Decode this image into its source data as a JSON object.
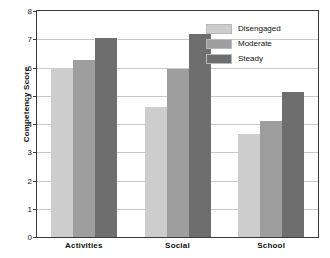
{
  "chart_data": {
    "type": "bar",
    "title": "",
    "xlabel": "",
    "ylabel": "Competency Score",
    "categories": [
      "Activities",
      "Social",
      "School"
    ],
    "series": [
      {
        "name": "Disengaged",
        "color": "#cdcdcd",
        "values": [
          6.0,
          4.6,
          3.65
        ]
      },
      {
        "name": "Moderate",
        "color": "#9e9e9e",
        "values": [
          6.25,
          5.95,
          4.1
        ]
      },
      {
        "name": "Steady",
        "color": "#6e6e6e",
        "values": [
          7.05,
          7.2,
          5.15
        ]
      }
    ],
    "ylim": [
      0,
      8
    ],
    "yticks": [
      0,
      1,
      2,
      3,
      4,
      5,
      6,
      7,
      8
    ],
    "ytick_labels": [
      "0",
      "1",
      "2",
      "3",
      "4",
      "5",
      "6",
      "7",
      "8"
    ],
    "grid": true,
    "legend_position": "top-right"
  }
}
